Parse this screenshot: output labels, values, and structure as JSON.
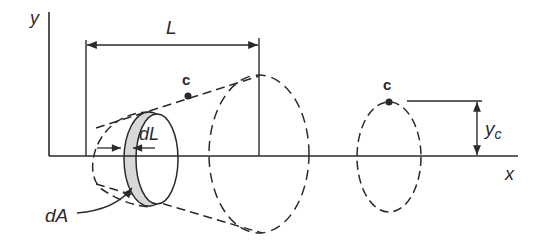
{
  "diagram": {
    "axes": {
      "y_label": "y",
      "x_label": "x"
    },
    "dimensions": {
      "length_label": "L",
      "element_thickness_label": "dL",
      "element_area_label": "dA",
      "centroid_offset_label_main": "y",
      "centroid_offset_label_sub": "c"
    },
    "points": {
      "centroid_on_cone": "c",
      "centroid_on_ring": "c"
    },
    "colors": {
      "line": "#2a2a2a",
      "shading": "#d8d8d8",
      "background": "#ffffff"
    }
  }
}
